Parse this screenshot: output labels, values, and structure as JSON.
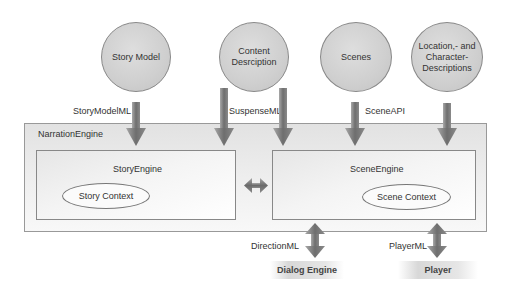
{
  "diagram": {
    "sources": [
      {
        "id": "story-model",
        "label": "Story Model"
      },
      {
        "id": "content-description",
        "label": "Content Desrciption"
      },
      {
        "id": "scenes",
        "label": "Scenes"
      },
      {
        "id": "location-character",
        "label": "Location,- and Character-Descriptions"
      }
    ],
    "interfaces": {
      "story_model_ml": "StoryModelML",
      "suspense_ml": "SuspenseML",
      "scene_api": "SceneAPI",
      "direction_ml": "DirectionML",
      "player_ml": "PlayerML"
    },
    "narration_engine": {
      "label": "NarrationEngine",
      "story_engine": {
        "label": "StoryEngine",
        "context": "Story Context"
      },
      "scene_engine": {
        "label": "SceneEngine",
        "context": "Scene Context"
      }
    },
    "outputs": [
      {
        "id": "dialog-engine",
        "label": "Dialog Engine"
      },
      {
        "id": "player",
        "label": "Player"
      }
    ],
    "colors": {
      "circle_fill": "#cfcfcf",
      "arrow_dark": "#6e6e6e",
      "arrow_light": "#a8a8a8",
      "box_border": "#888888"
    }
  }
}
